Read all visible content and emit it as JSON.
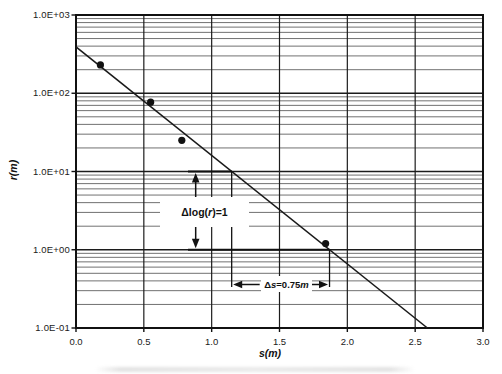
{
  "figure": {
    "x_axis_title": "s(m)",
    "y_axis_title": "r(m)",
    "annotation_slope": {
      "pre": "Δlog(",
      "var": "r",
      "post": ")=1"
    },
    "annotation_ds": {
      "pre": "Δ",
      "var": "s",
      "mid": "=0.75 ",
      "unit": "m"
    }
  },
  "chart_data": {
    "type": "scatter",
    "title": "",
    "xlabel": "s(m)",
    "ylabel": "r(m)",
    "xscale": "linear",
    "yscale": "log",
    "xlim": [
      0.0,
      3.0
    ],
    "ylim": [
      0.1,
      1000
    ],
    "x_ticks": [
      0.0,
      0.5,
      1.0,
      1.5,
      2.0,
      2.5,
      3.0
    ],
    "x_tick_labels": [
      "0.0",
      "0.5",
      "1.0",
      "1.5",
      "2.0",
      "2.5",
      "3.0"
    ],
    "y_ticks": [
      1000,
      100,
      10,
      1,
      0.1
    ],
    "y_tick_labels": [
      "1.0E+03",
      "1.0E+02",
      "1.0E+01",
      "1.0E+00",
      "1.0E-01"
    ],
    "grid": {
      "x_major_step": 0.5,
      "y_minor_multipliers": [
        2,
        3,
        4,
        5,
        6,
        7,
        8,
        9
      ],
      "grid_on": true
    },
    "legend": "none",
    "points": [
      {
        "s": 0.18,
        "r": 230
      },
      {
        "s": 0.55,
        "r": 77
      },
      {
        "s": 0.78,
        "r": 25
      },
      {
        "s": 1.84,
        "r": 1.2
      }
    ],
    "fit_line": {
      "s_start": 0.0,
      "r_start": 390,
      "s_end": 2.59,
      "r_end": 0.1
    },
    "slope_triangle": {
      "r_top": 10,
      "r_bottom": 1,
      "delta_log_r": 1,
      "delta_s_m": 0.75
    },
    "annotations": [
      {
        "text": "Δlog(r)=1",
        "anchor": "between arrows at s≈0.9"
      },
      {
        "text": "Δs=0.75 m",
        "anchor": "between dimension arrows below r=1"
      }
    ]
  },
  "colors": {
    "background": "#ffffff",
    "text": "#1a1a1a",
    "plot_border": "#111111",
    "grid_major": "#1c1c1c",
    "grid_minor": "#4d4d4d",
    "fit_line": "#1a1a1a",
    "point_fill": "#111111",
    "construction": "#111111"
  }
}
